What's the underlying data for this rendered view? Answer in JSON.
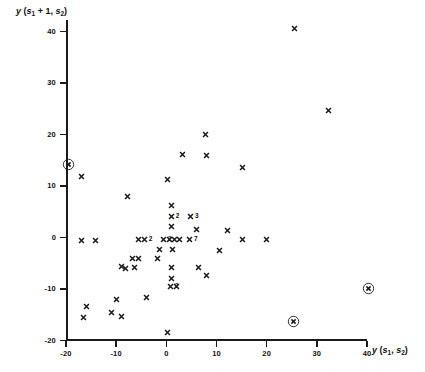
{
  "chart_data": {
    "type": "scatter",
    "title": "",
    "xlabel": "y (s1, s2)",
    "ylabel": "y (s1 + 1, s2)",
    "xlim": [
      -20,
      40
    ],
    "ylim": [
      -20,
      40
    ],
    "xticks": [
      -20,
      -10,
      0,
      10,
      20,
      30,
      40
    ],
    "yticks": [
      -20,
      -10,
      0,
      10,
      20,
      30,
      40
    ],
    "xtick_labels": [
      "-20",
      "-10",
      "0",
      "10",
      "20",
      "30",
      "40"
    ],
    "ytick_labels": [
      "-20",
      "-10",
      "0",
      "10",
      "20",
      "30",
      "40"
    ],
    "grid": false,
    "legend": null,
    "marker": "x",
    "outlier_marker": "circled-x",
    "points": [
      {
        "x": -19.5,
        "y": 14.0,
        "marker": "circled-x"
      },
      {
        "x": 25.4,
        "y": -16.5,
        "marker": "circled-x"
      },
      {
        "x": 40.3,
        "y": -10.0,
        "marker": "circled-x"
      },
      {
        "x": 25.6,
        "y": 40.5,
        "marker": "x"
      },
      {
        "x": 32.3,
        "y": 24.5,
        "marker": "x"
      },
      {
        "x": 7.8,
        "y": 20.0,
        "marker": "x"
      },
      {
        "x": 3.2,
        "y": 16.0,
        "marker": "x"
      },
      {
        "x": 8.0,
        "y": 15.8,
        "marker": "x"
      },
      {
        "x": 15.2,
        "y": 13.5,
        "marker": "x"
      },
      {
        "x": -17.0,
        "y": 11.8,
        "marker": "x"
      },
      {
        "x": 0.3,
        "y": 11.2,
        "marker": "x"
      },
      {
        "x": -7.8,
        "y": 7.8,
        "marker": "x"
      },
      {
        "x": 1.0,
        "y": 6.2,
        "marker": "x"
      },
      {
        "x": 1.0,
        "y": 4.0,
        "marker": "x",
        "mult": "2"
      },
      {
        "x": 4.8,
        "y": 4.0,
        "marker": "x",
        "mult": "3"
      },
      {
        "x": 1.0,
        "y": 2.0,
        "marker": "x"
      },
      {
        "x": 6.0,
        "y": 1.5,
        "marker": "x"
      },
      {
        "x": 12.2,
        "y": 1.2,
        "marker": "x"
      },
      {
        "x": -17.0,
        "y": -0.6,
        "marker": "x"
      },
      {
        "x": -14.2,
        "y": -0.6,
        "marker": "x"
      },
      {
        "x": -5.6,
        "y": -0.4,
        "marker": "x"
      },
      {
        "x": -4.4,
        "y": -0.4,
        "marker": "x",
        "mult": "2"
      },
      {
        "x": -0.6,
        "y": -0.4,
        "marker": "x",
        "mult": "2"
      },
      {
        "x": 0.6,
        "y": -0.4,
        "marker": "x"
      },
      {
        "x": 1.6,
        "y": -0.4,
        "marker": "x"
      },
      {
        "x": 2.6,
        "y": -0.4,
        "marker": "x"
      },
      {
        "x": 4.6,
        "y": -0.4,
        "marker": "x",
        "mult": "7"
      },
      {
        "x": 15.2,
        "y": -0.4,
        "marker": "x"
      },
      {
        "x": 20.0,
        "y": -0.4,
        "marker": "x"
      },
      {
        "x": -1.4,
        "y": -2.4,
        "marker": "x"
      },
      {
        "x": 1.2,
        "y": -2.4,
        "marker": "x"
      },
      {
        "x": 10.6,
        "y": -2.6,
        "marker": "x"
      },
      {
        "x": -6.8,
        "y": -4.2,
        "marker": "x"
      },
      {
        "x": -5.6,
        "y": -4.2,
        "marker": "x"
      },
      {
        "x": -1.8,
        "y": -4.2,
        "marker": "x"
      },
      {
        "x": -9.0,
        "y": -5.8,
        "marker": "x"
      },
      {
        "x": -8.2,
        "y": -6.2,
        "marker": "x"
      },
      {
        "x": -6.4,
        "y": -6.0,
        "marker": "x"
      },
      {
        "x": 1.0,
        "y": -6.0,
        "marker": "x"
      },
      {
        "x": 6.4,
        "y": -6.0,
        "marker": "x"
      },
      {
        "x": 8.0,
        "y": -7.4,
        "marker": "x"
      },
      {
        "x": 1.0,
        "y": -8.0,
        "marker": "x"
      },
      {
        "x": 0.8,
        "y": -9.6,
        "marker": "x",
        "mult": "2"
      },
      {
        "x": 2.0,
        "y": -9.6,
        "marker": "x"
      },
      {
        "x": -4.0,
        "y": -11.8,
        "marker": "x"
      },
      {
        "x": -10.0,
        "y": -12.2,
        "marker": "x"
      },
      {
        "x": -16.0,
        "y": -13.4,
        "marker": "x"
      },
      {
        "x": -11.0,
        "y": -14.6,
        "marker": "x"
      },
      {
        "x": -9.0,
        "y": -15.4,
        "marker": "x"
      },
      {
        "x": -16.6,
        "y": -15.6,
        "marker": "x"
      },
      {
        "x": 0.2,
        "y": -18.6,
        "marker": "x"
      }
    ]
  }
}
